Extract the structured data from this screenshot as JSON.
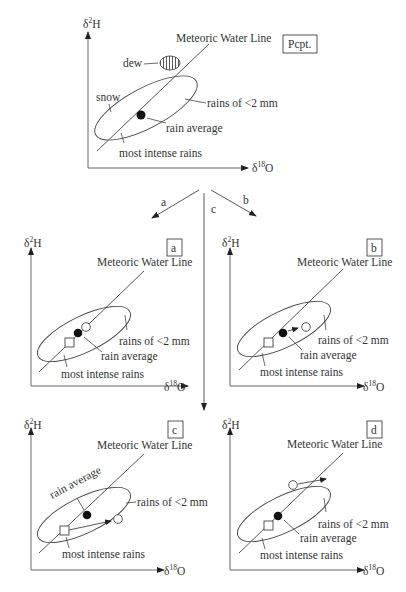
{
  "axes": {
    "y_label_main": "δ",
    "y_label_sup": "2",
    "y_label_tail": "H",
    "x_label_main": "δ",
    "x_label_sup": "18",
    "x_label_tail": "O"
  },
  "top_panel": {
    "tag": "Pcpt.",
    "labels": {
      "mwl": "Meteoric Water Line",
      "dew": "dew",
      "snow": "snow",
      "rains_small": "rains of <2 mm",
      "rain_average": "rain average",
      "intense": "most intense rains"
    }
  },
  "branches": {
    "a": "a",
    "b": "b",
    "c": "c"
  },
  "panels": [
    {
      "tag": "a",
      "labels": {
        "mwl": "Meteoric Water Line",
        "rains_small": "rains of <2 mm",
        "rain_average": "rain average",
        "intense": "most intense rains"
      }
    },
    {
      "tag": "b",
      "labels": {
        "mwl": "Meteoric Water Line",
        "rains_small": "rains of <2 mm",
        "rain_average": "rain average",
        "intense": "most intense rains"
      }
    },
    {
      "tag": "c",
      "labels": {
        "mwl": "Meteoric Water Line",
        "rains_small": "rains of <2 mm",
        "rain_average": "rain average",
        "intense": "most intense rains"
      }
    },
    {
      "tag": "d",
      "labels": {
        "mwl": "Meteoric Water Line",
        "rains_small": "rains of <2 mm",
        "rain_average": "rain average",
        "intense": "most intense rains"
      }
    }
  ]
}
